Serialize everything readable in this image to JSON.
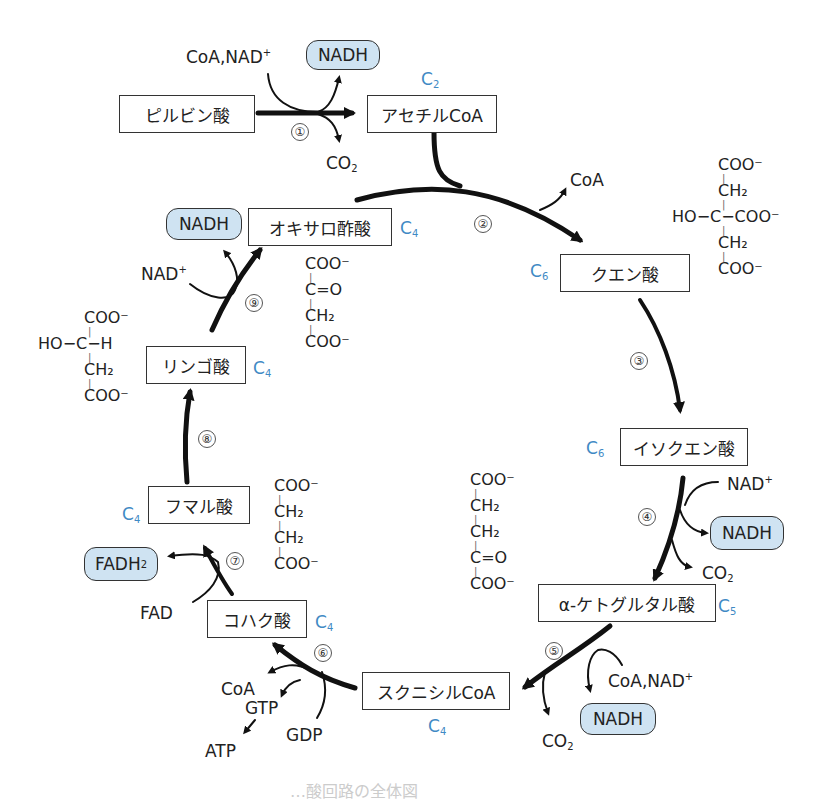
{
  "figure": {
    "caption_partial": "…酸回路の全体図",
    "colors": {
      "carbon_label": "#3f8ac4",
      "nadh_fill": "#cfe3f2",
      "arrow": "#111111"
    }
  },
  "compounds": {
    "pyruvate": {
      "name": "ピルビン酸"
    },
    "acetyl_coa": {
      "name": "アセチルCoA",
      "carbons": "2"
    },
    "citrate": {
      "name": "クエン酸",
      "carbons": "6"
    },
    "isocitrate": {
      "name": "イソクエン酸",
      "carbons": "6"
    },
    "ketoglutarate": {
      "name": "α-ケトグルタル酸",
      "carbons": "5"
    },
    "succinyl_coa": {
      "name": "スクニシルCoA",
      "carbons": "4"
    },
    "succinate": {
      "name": "コハク酸",
      "carbons": "4"
    },
    "fumarate": {
      "name": "フマル酸",
      "carbons": "4"
    },
    "malate": {
      "name": "リンゴ酸",
      "carbons": "4"
    },
    "oxaloacetate": {
      "name": "オキサロ酢酸",
      "carbons": "4"
    }
  },
  "steps": [
    "①",
    "②",
    "③",
    "④",
    "⑤",
    "⑥",
    "⑦",
    "⑧",
    "⑨"
  ],
  "cofactors": {
    "s1_in": "CoA,NAD",
    "s1_out_nadh": "NADH",
    "s1_out_co2": "CO",
    "s2_out": "CoA",
    "s4_in": "NAD",
    "s4_out_nadh": "NADH",
    "s4_out_co2": "CO",
    "s5_in": "CoA,NAD",
    "s5_out_nadh": "NADH",
    "s5_out_co2": "CO",
    "s6_out_coa": "CoA",
    "s6_out_gtp": "GTP",
    "s6_in_gdp": "GDP",
    "s6_atp": "ATP",
    "s7_in": "FAD",
    "s7_out": "FADH",
    "s9_in": "NAD",
    "s9_out": "NADH"
  },
  "structures": {
    "citrate": [
      "COO⁻",
      "CH₂",
      "HO−C−COO⁻",
      "CH₂",
      "COO⁻"
    ],
    "oxaloacetate": [
      "COO⁻",
      "C=O",
      "CH₂",
      "COO⁻"
    ],
    "malate": [
      "COO⁻",
      "HO−C−H",
      "CH₂",
      "COO⁻"
    ],
    "ketoglutarate": [
      "COO⁻",
      "CH₂",
      "CH₂",
      "C=O",
      "COO⁻"
    ],
    "succinate": [
      "COO⁻",
      "CH₂",
      "CH₂",
      "COO⁻"
    ]
  }
}
